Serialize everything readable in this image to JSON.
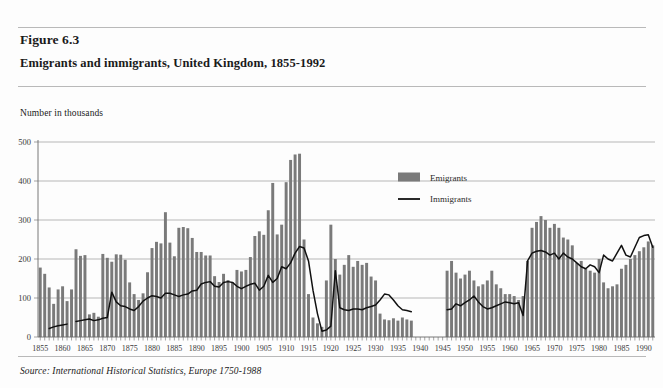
{
  "figure": {
    "number_label": "Figure 6.3",
    "title": "Emigrants and immigrants, United Kingdom, 1855-1992",
    "unit_label": "Number in thousands",
    "source": "Source: International Historical Statistics, Europe 1750-1988"
  },
  "legend": {
    "emigrants_label": "Emigrants",
    "immigrants_label": "Immigrants",
    "emigrants_color": "#7a7a7a",
    "immigrants_color": "#111111",
    "position": "inside-upper-right"
  },
  "chart_data": {
    "type": "bar",
    "title": "Emigrants and immigrants, United Kingdom, 1855-1992",
    "subtitle": "Figure 6.3",
    "xlabel": "",
    "ylabel": "Number in thousands",
    "ylim": [
      0,
      500
    ],
    "ytick_values": [
      0,
      100,
      200,
      300,
      400,
      500
    ],
    "ytick_labels": [
      "0",
      "100",
      "200",
      "300",
      "400",
      "500"
    ],
    "grid": true,
    "xtick_labels": [
      "1855",
      "1860",
      "1865",
      "1870",
      "1875",
      "1880",
      "1885",
      "1890",
      "1895",
      "1900",
      "1905",
      "1910",
      "1915",
      "1920",
      "1925",
      "1930",
      "1935",
      "1940",
      "1945",
      "1950",
      "1955",
      "1960",
      "1965",
      "1970",
      "1975",
      "1980",
      "1985",
      "1990"
    ],
    "x_start": 1855,
    "x_end": 1992,
    "gap_years": [
      1939,
      1940,
      1941,
      1942,
      1943,
      1944,
      1945
    ],
    "series": [
      {
        "name": "Emigrants",
        "type": "bar",
        "color": "#7a7a7a",
        "x": [
          1855,
          1856,
          1857,
          1858,
          1859,
          1860,
          1861,
          1862,
          1863,
          1864,
          1865,
          1866,
          1867,
          1868,
          1869,
          1870,
          1871,
          1872,
          1873,
          1874,
          1875,
          1876,
          1877,
          1878,
          1879,
          1880,
          1881,
          1882,
          1883,
          1884,
          1885,
          1886,
          1887,
          1888,
          1889,
          1890,
          1891,
          1892,
          1893,
          1894,
          1895,
          1896,
          1897,
          1898,
          1899,
          1900,
          1901,
          1902,
          1903,
          1904,
          1905,
          1906,
          1907,
          1908,
          1909,
          1910,
          1911,
          1912,
          1913,
          1914,
          1915,
          1916,
          1917,
          1918,
          1919,
          1920,
          1921,
          1922,
          1923,
          1924,
          1925,
          1926,
          1927,
          1928,
          1929,
          1930,
          1931,
          1932,
          1933,
          1934,
          1935,
          1936,
          1937,
          1938,
          1946,
          1947,
          1948,
          1949,
          1950,
          1951,
          1952,
          1953,
          1954,
          1955,
          1956,
          1957,
          1958,
          1959,
          1960,
          1961,
          1962,
          1963,
          1964,
          1965,
          1966,
          1967,
          1968,
          1969,
          1970,
          1971,
          1972,
          1973,
          1974,
          1975,
          1976,
          1977,
          1978,
          1979,
          1980,
          1981,
          1982,
          1983,
          1984,
          1985,
          1986,
          1987,
          1988,
          1989,
          1990,
          1991,
          1992
        ],
        "values": [
          178,
          162,
          127,
          85,
          122,
          130,
          92,
          122,
          225,
          208,
          210,
          58,
          62,
          52,
          213,
          203,
          193,
          212,
          211,
          198,
          140,
          110,
          95,
          112,
          166,
          228,
          244,
          240,
          320,
          242,
          207,
          280,
          282,
          279,
          254,
          218,
          218,
          209,
          209,
          156,
          141,
          162,
          146,
          140,
          172,
          168,
          172,
          205,
          259,
          271,
          262,
          325,
          395,
          263,
          288,
          397,
          454,
          468,
          470,
          250,
          110,
          50,
          35,
          26,
          145,
          288,
          200,
          160,
          185,
          210,
          180,
          195,
          185,
          190,
          155,
          145,
          60,
          45,
          43,
          48,
          42,
          50,
          45,
          42,
          170,
          195,
          165,
          150,
          160,
          170,
          145,
          130,
          135,
          145,
          170,
          135,
          125,
          110,
          110,
          105,
          95,
          105,
          195,
          280,
          295,
          310,
          300,
          280,
          290,
          280,
          255,
          250,
          235,
          190,
          195,
          175,
          170,
          165,
          200,
          140,
          125,
          130,
          135,
          175,
          185,
          200,
          210,
          220,
          230,
          245,
          235
        ],
        "note": "Bars absent for 1939-1945 (Second World War, no data)"
      },
      {
        "name": "Immigrants",
        "type": "line",
        "color": "#111111",
        "x": [
          1857,
          1858,
          1859,
          1860,
          1861,
          1863,
          1864,
          1865,
          1866,
          1867,
          1868,
          1869,
          1870,
          1871,
          1872,
          1873,
          1874,
          1875,
          1876,
          1877,
          1878,
          1879,
          1880,
          1881,
          1882,
          1883,
          1884,
          1885,
          1886,
          1887,
          1888,
          1889,
          1890,
          1891,
          1892,
          1893,
          1894,
          1895,
          1896,
          1897,
          1898,
          1899,
          1900,
          1901,
          1902,
          1903,
          1904,
          1905,
          1906,
          1907,
          1908,
          1909,
          1910,
          1911,
          1912,
          1913,
          1914,
          1915,
          1916,
          1917,
          1918,
          1919,
          1920,
          1921,
          1922,
          1923,
          1924,
          1925,
          1926,
          1927,
          1928,
          1929,
          1930,
          1931,
          1932,
          1933,
          1934,
          1935,
          1936,
          1937,
          1938,
          1946,
          1947,
          1948,
          1949,
          1950,
          1951,
          1952,
          1953,
          1954,
          1955,
          1956,
          1957,
          1958,
          1959,
          1960,
          1961,
          1962,
          1963,
          1964,
          1965,
          1966,
          1967,
          1968,
          1969,
          1970,
          1971,
          1972,
          1973,
          1974,
          1975,
          1976,
          1977,
          1978,
          1979,
          1980,
          1981,
          1982,
          1983,
          1984,
          1985,
          1986,
          1987,
          1988,
          1989,
          1990,
          1991,
          1992
        ],
        "values": [
          22,
          26,
          29,
          31,
          33,
          40,
          42,
          44,
          46,
          42,
          44,
          48,
          50,
          115,
          90,
          80,
          78,
          72,
          68,
          78,
          92,
          100,
          106,
          104,
          100,
          112,
          112,
          108,
          104,
          108,
          110,
          118,
          120,
          136,
          140,
          142,
          130,
          128,
          140,
          142,
          140,
          130,
          124,
          130,
          135,
          138,
          120,
          130,
          158,
          140,
          150,
          180,
          175,
          190,
          215,
          232,
          228,
          195,
          120,
          60,
          15,
          18,
          28,
          170,
          75,
          70,
          68,
          72,
          72,
          70,
          75,
          78,
          82,
          95,
          110,
          108,
          95,
          80,
          70,
          68,
          65,
          70,
          72,
          85,
          80,
          88,
          95,
          105,
          90,
          78,
          72,
          75,
          80,
          85,
          90,
          88,
          85,
          88,
          55,
          195,
          215,
          220,
          222,
          218,
          210,
          215,
          200,
          215,
          205,
          200,
          190,
          180,
          175,
          185,
          180,
          165,
          210,
          200,
          195,
          215,
          235,
          210,
          205,
          230,
          255,
          260,
          262,
          230
        ]
      }
    ]
  }
}
